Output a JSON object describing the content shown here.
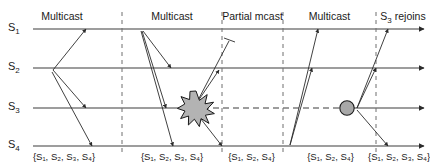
{
  "figure": {
    "width": 430,
    "height": 166,
    "colors": {
      "line": "#3c3c3c",
      "arrow": "#2b2b2b",
      "divider": "#6e6e6e",
      "star_fill": "#b3b3b3",
      "star_stroke": "#1a1a1a",
      "circle_fill": "#a8a8a8",
      "circle_stroke": "#1a1a1a",
      "text": "#1a1a1a",
      "background": "#ffffff"
    }
  },
  "processes": [
    {
      "id": "S1",
      "label": "S",
      "sub": "1",
      "y": 29
    },
    {
      "id": "S2",
      "label": "S",
      "sub": "2",
      "y": 68
    },
    {
      "id": "S3",
      "label": "S",
      "sub": "3",
      "y": 108
    },
    {
      "id": "S4",
      "label": "S",
      "sub": "4",
      "y": 146
    }
  ],
  "phases": [
    {
      "label": "Multicast",
      "center_x": 62,
      "divider_x": 122
    },
    {
      "label": "Multicast",
      "center_x": 172,
      "divider_x": 222
    },
    {
      "label": "Partial mcast",
      "center_x": 252,
      "divider_x": 283
    },
    {
      "label": "Multicast",
      "center_x": 330,
      "divider_x": 376
    },
    {
      "label": "S₃ rejoins",
      "center_x": 400,
      "divider_x": null
    }
  ],
  "delivery_sets": [
    {
      "text": "{S₁, S₂, S₃, S₄}",
      "center_x": 64,
      "parts": [
        "S",
        "1",
        "S",
        "2",
        "S",
        "3",
        "S",
        "4"
      ]
    },
    {
      "text": "{S₁, S₂, S₃, S₄}",
      "center_x": 172,
      "parts": [
        "S",
        "1",
        "S",
        "2",
        "S",
        "3",
        "S",
        "4"
      ]
    },
    {
      "text": "{S₁, S₂, S₄}",
      "center_x": 251,
      "parts": [
        "S",
        "1",
        "S",
        "2",
        "S",
        "4"
      ]
    },
    {
      "text": "{S₁, S₂, S₄}",
      "center_x": 330,
      "parts": [
        "S",
        "1",
        "S",
        "2",
        "S",
        "4"
      ]
    },
    {
      "text": "{S₁, S₂, S₃, S₄}",
      "center_x": 401,
      "parts": [
        "S",
        "1",
        "S",
        "2",
        "S",
        "3",
        "S",
        "4"
      ]
    }
  ],
  "events": {
    "crash": {
      "name": "crash-star",
      "x": 196,
      "y": 108,
      "on": "S3"
    },
    "rejoin": {
      "name": "rejoin-circle",
      "x": 347,
      "y": 108,
      "on": "S3"
    }
  },
  "messages": [
    {
      "from": "S2",
      "to": "S1",
      "label": "multicast-1-to-s1"
    },
    {
      "from": "S2",
      "to": "S3",
      "label": "multicast-1-to-s3"
    },
    {
      "from": "S2",
      "to": "S4",
      "label": "multicast-1-to-s4"
    },
    {
      "from": "S1",
      "to": "S2",
      "label": "multicast-2-to-s2"
    },
    {
      "from": "S1",
      "to": "S3",
      "label": "multicast-2-to-s3"
    },
    {
      "from": "S1",
      "to": "S4",
      "label": "multicast-2-to-s4"
    },
    {
      "from": "S3",
      "to": "S1",
      "label": "partial-mcast-to-s1-lost"
    },
    {
      "from": "S3",
      "to": "S2",
      "label": "partial-mcast-to-s2"
    },
    {
      "from": "S3",
      "to": "S4",
      "label": "partial-mcast-to-s4"
    },
    {
      "from": "S4",
      "to": "S1",
      "label": "multicast-4-to-s1"
    },
    {
      "from": "S4",
      "to": "S2",
      "label": "multicast-4-to-s2"
    },
    {
      "from": "S3",
      "to": "S1",
      "label": "rejoin-mcast-to-s1"
    },
    {
      "from": "S3",
      "to": "S2",
      "label": "rejoin-mcast-to-s2"
    },
    {
      "from": "S3",
      "to": "S4",
      "label": "rejoin-mcast-to-s4"
    }
  ]
}
